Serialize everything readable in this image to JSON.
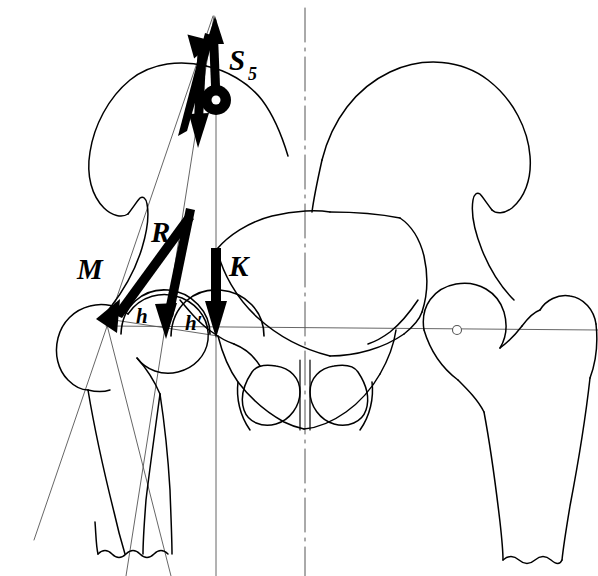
{
  "figure": {
    "background_color": "#ffffff",
    "ink_color": "#000000"
  },
  "labels": {
    "muscle_force": "M",
    "resultant_force": "R",
    "body_weight_force": "K",
    "lever_arm_muscle": "h",
    "lever_arm_weight": "h′",
    "center_of_gravity": "S",
    "center_of_gravity_subscript": "5"
  },
  "vectors": [
    {
      "name": "M",
      "meaning": "abductor muscle force",
      "style": "thick-solid-arrow",
      "direction": "down-left",
      "tail": [
        189,
        216
      ],
      "head": [
        106,
        321
      ]
    },
    {
      "name": "R",
      "meaning": "resultant hip joint force",
      "style": "thick-solid-arrow",
      "direction": "down-slightly-left",
      "tail": [
        190,
        210
      ],
      "head": [
        166,
        333
      ]
    },
    {
      "name": "K",
      "meaning": "partial body weight",
      "style": "thick-solid-arrow",
      "direction": "straight-down",
      "tail": [
        216,
        248
      ],
      "head": [
        216,
        330
      ]
    },
    {
      "name": "M-up",
      "meaning": "muscle force transferred to force parallelogram",
      "style": "thick-solid-arrow",
      "direction": "up-right",
      "tail": [
        182,
        130
      ],
      "head": [
        215,
        18
      ]
    },
    {
      "name": "K-up",
      "meaning": "weight force transferred to force parallelogram",
      "style": "thick-solid-arrow",
      "direction": "up",
      "tail": [
        212,
        85
      ],
      "head": [
        215,
        18
      ]
    },
    {
      "name": "R-down",
      "meaning": "resultant in force parallelogram",
      "style": "thick-solid-arrow",
      "direction": "down",
      "tail": [
        207,
        40
      ],
      "head": [
        199,
        138
      ]
    }
  ],
  "markers": {
    "center_of_gravity_point": {
      "x": 216,
      "y": 100,
      "style": "filled-ring"
    },
    "right_hip_center": {
      "x": 457,
      "y": 330,
      "style": "open-circle"
    },
    "left_hip_center": {
      "x": 166,
      "y": 332,
      "style": "implied"
    }
  },
  "reference_lines": [
    {
      "name": "midsagittal-axis",
      "style": "dash-dot",
      "orientation": "vertical",
      "x": 305
    },
    {
      "name": "body-weight-line-of-action",
      "style": "thin-solid",
      "orientation": "vertical",
      "x": 216
    },
    {
      "name": "gravity-vertical-through-S5",
      "style": "thin-solid",
      "orientation": "vertical",
      "x": 216
    },
    {
      "name": "interhip-horizontal-axis",
      "style": "thin-solid",
      "orientation": "horizontal",
      "y": 330
    },
    {
      "name": "muscle-line-of-action",
      "style": "thin-solid",
      "orientation": "oblique"
    },
    {
      "name": "femoral-shaft-axis",
      "style": "thin-solid",
      "orientation": "oblique"
    }
  ],
  "arcs": [
    {
      "name": "lever-arm-arc-h",
      "label": "h",
      "label_pos": [
        142,
        316
      ]
    },
    {
      "name": "lever-arm-arc-h-prime",
      "label": "h′",
      "label_pos": [
        191,
        323
      ]
    }
  ],
  "anatomy": [
    "left-ilium",
    "right-ilium",
    "sacrum",
    "left-obturator-foramen",
    "right-obturator-foramen",
    "left-femur",
    "right-femur",
    "pubic-symphysis"
  ]
}
